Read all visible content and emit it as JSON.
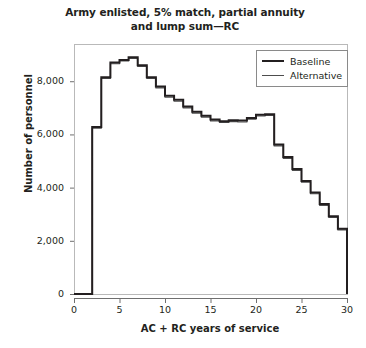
{
  "chart_data": {
    "type": "line",
    "subtype": "step",
    "title": "Army enlisted, 5% match, partial annuity and lump sum—RC",
    "title_lines": [
      "Army enlisted, 5% match, partial annuity",
      "and lump sum—RC"
    ],
    "xlabel": "AC + RC years of service",
    "ylabel": "Number of personnel",
    "xlim": [
      0,
      30
    ],
    "ylim": [
      0,
      9400
    ],
    "xticks": [
      0,
      5,
      10,
      15,
      20,
      25,
      30
    ],
    "xtick_labels": [
      "0",
      "5",
      "10",
      "15",
      "20",
      "25",
      "30"
    ],
    "yticks": [
      0,
      2000,
      4000,
      6000,
      8000
    ],
    "ytick_labels": [
      "0",
      "2,000",
      "4,000",
      "6,000",
      "8,000"
    ],
    "grid": false,
    "legend_position": "top-right",
    "x": [
      0,
      1,
      2,
      3,
      4,
      5,
      6,
      7,
      8,
      9,
      10,
      11,
      12,
      13,
      14,
      15,
      16,
      17,
      18,
      19,
      20,
      21,
      22,
      23,
      24,
      25,
      26,
      27,
      28,
      29,
      30
    ],
    "series": [
      {
        "name": "Baseline",
        "color": "#231f20",
        "line_width": 2.0,
        "values": [
          0,
          0,
          6280,
          8150,
          8700,
          8800,
          8900,
          8600,
          8150,
          7800,
          7450,
          7300,
          7050,
          6850,
          6700,
          6560,
          6500,
          6530,
          6520,
          6620,
          6740,
          6760,
          5620,
          5150,
          4700,
          4250,
          3820,
          3380,
          2920,
          2450,
          1700
        ]
      },
      {
        "name": "Alternative",
        "color": "#4d4d4d",
        "line_width": 1.1,
        "values": [
          0,
          0,
          6230,
          8100,
          8660,
          8760,
          8860,
          8560,
          8100,
          7750,
          7400,
          7250,
          7000,
          6800,
          6650,
          6510,
          6450,
          6480,
          6470,
          6570,
          6690,
          6710,
          5570,
          5100,
          4650,
          4200,
          3770,
          3330,
          2880,
          2410,
          1660
        ]
      }
    ]
  },
  "legend": {
    "items": [
      {
        "label": "Baseline"
      },
      {
        "label": "Alternative"
      }
    ]
  }
}
